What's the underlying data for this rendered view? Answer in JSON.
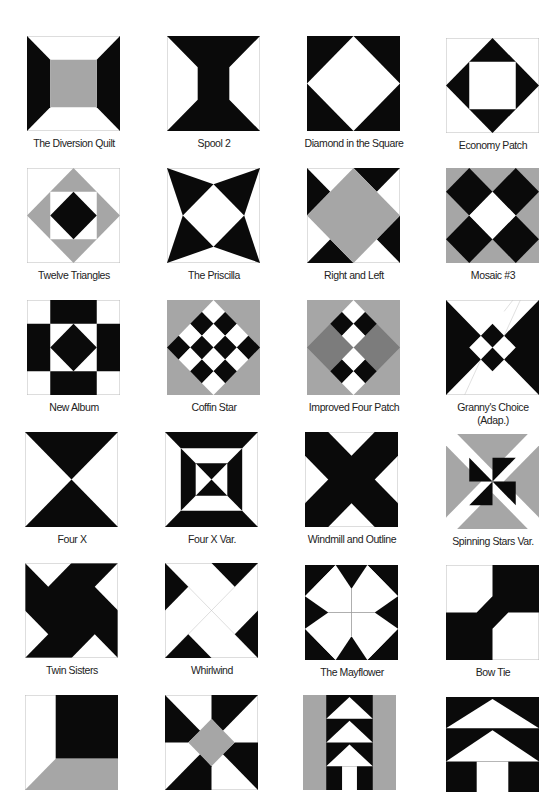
{
  "colors": {
    "black": "#0a0a0a",
    "gray": "#a6a6a6",
    "darkgray": "#7c7c7c",
    "white": "#ffffff",
    "border": "#b8b8b8"
  },
  "blocks": [
    {
      "name": "The Diversion Quilt"
    },
    {
      "name": "Spool 2"
    },
    {
      "name": "Diamond in the Square"
    },
    {
      "name": "Economy Patch"
    },
    {
      "name": "Twelve Triangles"
    },
    {
      "name": "The Priscilla"
    },
    {
      "name": "Right and Left"
    },
    {
      "name": "Mosaic #3"
    },
    {
      "name": "New  Album"
    },
    {
      "name": "Coffin Star"
    },
    {
      "name": "Improved Four Patch"
    },
    {
      "name": "Granny's Choice",
      "sub": "(Adap.)"
    },
    {
      "name": "Four X"
    },
    {
      "name": "Four X Var."
    },
    {
      "name": "Windmill and Outline"
    },
    {
      "name": "Spinning Stars Var."
    },
    {
      "name": "Twin Sisters"
    },
    {
      "name": "Whirlwind"
    },
    {
      "name": "The Mayflower"
    },
    {
      "name": "Bow Tie"
    },
    {
      "name": ""
    },
    {
      "name": ""
    },
    {
      "name": ""
    },
    {
      "name": ""
    }
  ]
}
